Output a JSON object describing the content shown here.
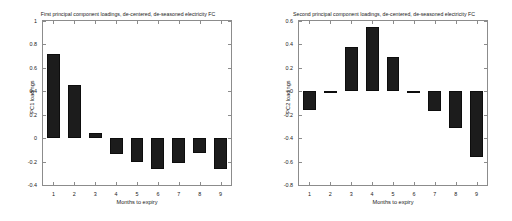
{
  "figure": {
    "background_color": "#ffffff",
    "bar_color": "#1c1c1c",
    "axis_color": "#8c8c8c"
  },
  "panels": [
    {
      "id": "pc1",
      "title": "First principal component loadings, de-centered, de-seasoned electricity FC",
      "xlabel": "Months to expiry",
      "ylabel": "PC1 loadings",
      "yticks": [
        "1",
        "0.8",
        "0.6",
        "0.4",
        "0.2",
        "0",
        "-0.2",
        "-0.4"
      ],
      "ytick_values": [
        1,
        0.8,
        0.6,
        0.4,
        0.2,
        0,
        -0.2,
        -0.4
      ],
      "xticks": [
        "1",
        "2",
        "3",
        "4",
        "5",
        "6",
        "7",
        "8",
        "9"
      ]
    },
    {
      "id": "pc2",
      "title": "Second principal component loadings, de-centered, de-seasoned electricity FC",
      "xlabel": "Months to expiry",
      "ylabel": "PC2 loadings",
      "yticks": [
        "0.6",
        "0.4",
        "0.2",
        "0",
        "-0.2",
        "-0.4",
        "-0.6",
        "-0.8"
      ],
      "ytick_values": [
        0.6,
        0.4,
        0.2,
        0,
        -0.2,
        -0.4,
        -0.6,
        -0.8
      ],
      "xticks": [
        "1",
        "2",
        "3",
        "4",
        "5",
        "6",
        "7",
        "8",
        "9"
      ]
    }
  ],
  "chart_data": [
    {
      "type": "bar",
      "title": "First principal component loadings, de-centered, de-seasoned electricity FC",
      "xlabel": "Months to expiry",
      "ylabel": "PC1 loadings",
      "categories": [
        "1",
        "2",
        "3",
        "4",
        "5",
        "6",
        "7",
        "8",
        "9"
      ],
      "values": [
        0.72,
        0.45,
        0.045,
        -0.135,
        -0.2,
        -0.265,
        -0.215,
        -0.13,
        -0.26
      ],
      "ylim": [
        -0.4,
        1.0
      ],
      "ytick_interval": 0.2,
      "grid": false,
      "legend": false,
      "bar_color": "#1c1c1c"
    },
    {
      "type": "bar",
      "title": "Second principal component loadings, de-centered, de-seasoned electricity FC",
      "xlabel": "Months to expiry",
      "ylabel": "PC2 loadings",
      "categories": [
        "1",
        "2",
        "3",
        "4",
        "5",
        "6",
        "7",
        "8",
        "9"
      ],
      "values": [
        -0.16,
        0.005,
        0.375,
        0.55,
        0.29,
        0.005,
        -0.165,
        -0.315,
        -0.565
      ],
      "ylim": [
        -0.8,
        0.6
      ],
      "ytick_interval": 0.2,
      "grid": false,
      "legend": false,
      "bar_color": "#1c1c1c"
    }
  ]
}
